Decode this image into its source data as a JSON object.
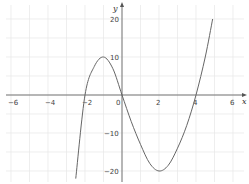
{
  "chart_data": {
    "type": "line",
    "title": "",
    "xlabel": "x",
    "ylabel": "y",
    "xlim": [
      -6.3,
      6.6
    ],
    "ylim": [
      -22,
      23
    ],
    "grid": true,
    "x_ticks": [
      -6,
      -4,
      -2,
      0,
      2,
      4,
      6
    ],
    "x_tick_labels": [
      "−6",
      "−4",
      "−2",
      "0",
      "2",
      "4",
      "6"
    ],
    "y_ticks": [
      20,
      10,
      -10,
      -20
    ],
    "y_tick_labels": [
      "20",
      "10",
      "−10",
      "−20"
    ],
    "series": [
      {
        "name": "cubic curve",
        "x": [
          -2.5,
          -2,
          -1.5,
          -1,
          -0.5,
          0,
          0.5,
          1,
          1.5,
          2,
          2.5,
          3,
          3.5,
          4,
          4.5,
          4.9
        ],
        "y": [
          -22,
          0,
          7.5,
          10,
          7,
          0,
          -7,
          -13,
          -18,
          -20,
          -18.5,
          -14,
          -8,
          0,
          10,
          20
        ]
      }
    ],
    "annotations": [
      "roots at x = -2, 0, 4",
      "local max ≈ 10 near x = -1",
      "local min ≈ -20 at x = 2"
    ]
  }
}
